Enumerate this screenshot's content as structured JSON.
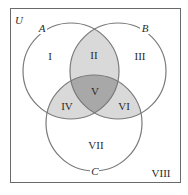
{
  "diagram": {
    "type": "venn",
    "universe_label": "U",
    "sets": [
      {
        "name": "A",
        "cx": 71,
        "cy": 71,
        "r": 48
      },
      {
        "name": "B",
        "cx": 118,
        "cy": 71,
        "r": 48
      },
      {
        "name": "C",
        "cx": 94,
        "cy": 123,
        "r": 48
      }
    ],
    "regions": [
      {
        "label": "I",
        "x": 50,
        "y": 57
      },
      {
        "label": "II",
        "x": 94,
        "y": 56
      },
      {
        "label": "III",
        "x": 140,
        "y": 57
      },
      {
        "label": "IV",
        "x": 68,
        "y": 107
      },
      {
        "label": "V",
        "x": 95,
        "y": 92
      },
      {
        "label": "VI",
        "x": 124,
        "y": 107
      },
      {
        "label": "VII",
        "x": 96,
        "y": 145
      },
      {
        "label": "VIII",
        "x": 160,
        "y": 174
      }
    ],
    "colors": {
      "stroke": "#7a7a7a",
      "pair_fill": "#d9d9d9",
      "triple_fill": "#a8a8a8",
      "rect_stroke": "#6a6a6a"
    }
  }
}
